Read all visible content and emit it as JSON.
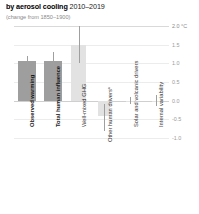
{
  "header": {
    "title_strong": "by aerosol cooling",
    "title_period": "2010–2019",
    "subtitle": "(change from 1850–1900)"
  },
  "axis": {
    "unit_label": "2.0 °C",
    "ticks": [
      "1.5",
      "1.0",
      "0.5",
      "0.0",
      "-0.5",
      "-1.0"
    ]
  },
  "chart_data": {
    "type": "bar",
    "title": "by aerosol cooling 2010–2019",
    "subtitle": "(change from 1850–1900)",
    "xlabel": "",
    "ylabel": "°C",
    "ylim": [
      -1.0,
      2.0
    ],
    "yticks": [
      -1.0,
      -0.5,
      0.0,
      0.5,
      1.0,
      1.5,
      2.0
    ],
    "grid": true,
    "legend": "none",
    "categories": [
      "Observed warming",
      "Total human influence",
      "Well-mixed GHG",
      "Other human drivers*",
      "Solar and volcanic drivers",
      "Internal variability"
    ],
    "values": [
      1.06,
      1.06,
      1.5,
      -0.4,
      0.0,
      0.0
    ],
    "err_low": [
      0.9,
      0.8,
      1.0,
      -0.8,
      -0.1,
      -0.15
    ],
    "err_high": [
      1.2,
      1.3,
      2.0,
      -0.1,
      0.1,
      0.15
    ],
    "colors": [
      "#9e9e9e",
      "#9e9e9e",
      "#e2e2e2",
      "#e2e2e2",
      "#e2e2e2",
      "#e2e2e2"
    ],
    "label_weights": [
      "bold",
      "bold",
      "regular",
      "regular",
      "regular",
      "regular"
    ]
  }
}
